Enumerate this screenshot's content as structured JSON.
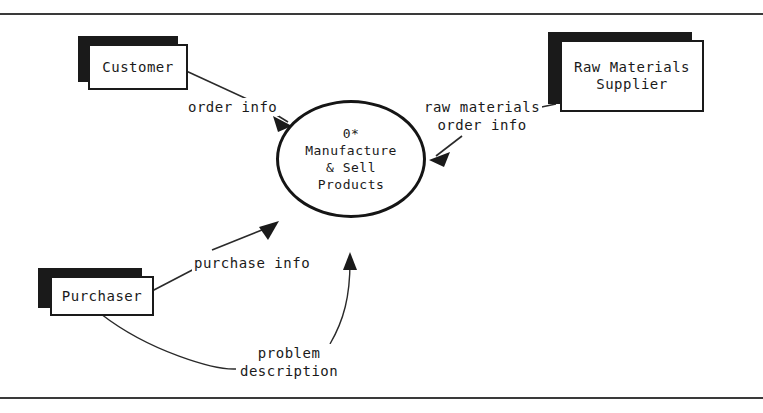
{
  "diagram": {
    "type": "context-data-flow-diagram",
    "frame": {
      "top_rule": true,
      "bottom_rule": true
    },
    "process": {
      "id": "0*",
      "name": "Manufacture\n& Sell\nProducts",
      "full_label": "0*\nManufacture\n& Sell\nProducts",
      "shape": "circle"
    },
    "entities": [
      {
        "key": "customer",
        "label": "Customer",
        "shape": "shadowed-rectangle"
      },
      {
        "key": "raw_materials_supplier",
        "label": "Raw Materials\nSupplier",
        "shape": "shadowed-rectangle"
      },
      {
        "key": "purchaser",
        "label": "Purchaser",
        "shape": "shadowed-rectangle"
      }
    ],
    "flows": [
      {
        "key": "order_info",
        "label": "order info",
        "from": "customer",
        "to": "process",
        "arrow": "into-process"
      },
      {
        "key": "raw_materials_order_info",
        "label": "raw materials\norder info",
        "from": "process",
        "to": "raw_materials_supplier",
        "arrow": "into-process"
      },
      {
        "key": "purchase_info",
        "label": "purchase info",
        "from": "purchaser",
        "to": "process",
        "arrow": "into-process"
      },
      {
        "key": "problem_description",
        "label": "problem\ndescription",
        "from": "purchaser",
        "to": "process",
        "arrow": "into-process"
      }
    ],
    "colors": {
      "ink": "#1a1a1a",
      "line": "#2a2a2a",
      "shadow": "#1a1a1a",
      "paper": "#ffffff"
    }
  }
}
